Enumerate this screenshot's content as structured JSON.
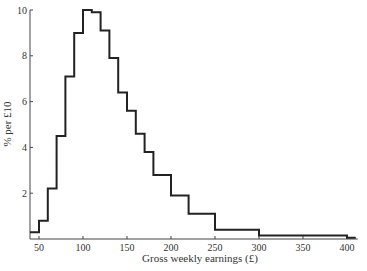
{
  "chart_data": {
    "type": "bar",
    "subtype": "histogram",
    "title": "",
    "xlabel": "Gross weekly earnings (£)",
    "ylabel": "% per £10",
    "xlim": [
      40,
      410
    ],
    "ylim": [
      0,
      10
    ],
    "x_ticks": [
      50,
      100,
      150,
      200,
      250,
      300,
      350,
      400
    ],
    "y_ticks": [
      2,
      4,
      6,
      8,
      10
    ],
    "grid": false,
    "legend": null,
    "bins": [
      {
        "from": 40,
        "to": 50,
        "value": 0.3
      },
      {
        "from": 50,
        "to": 60,
        "value": 0.8
      },
      {
        "from": 60,
        "to": 70,
        "value": 2.2
      },
      {
        "from": 70,
        "to": 80,
        "value": 4.5
      },
      {
        "from": 80,
        "to": 90,
        "value": 7.1
      },
      {
        "from": 90,
        "to": 100,
        "value": 9.0
      },
      {
        "from": 100,
        "to": 110,
        "value": 10.0
      },
      {
        "from": 110,
        "to": 120,
        "value": 9.9
      },
      {
        "from": 120,
        "to": 130,
        "value": 9.1
      },
      {
        "from": 130,
        "to": 140,
        "value": 7.9
      },
      {
        "from": 140,
        "to": 150,
        "value": 6.4
      },
      {
        "from": 150,
        "to": 160,
        "value": 5.6
      },
      {
        "from": 160,
        "to": 170,
        "value": 4.6
      },
      {
        "from": 170,
        "to": 180,
        "value": 3.8
      },
      {
        "from": 180,
        "to": 200,
        "value": 2.8
      },
      {
        "from": 200,
        "to": 220,
        "value": 1.9
      },
      {
        "from": 220,
        "to": 250,
        "value": 1.1
      },
      {
        "from": 250,
        "to": 300,
        "value": 0.4
      },
      {
        "from": 300,
        "to": 400,
        "value": 0.15
      },
      {
        "from": 400,
        "to": 410,
        "value": 0.05
      }
    ]
  },
  "labels": {
    "xlabel": "Gross weekly earnings (£)",
    "ylabel": "% per £10"
  },
  "colors": {
    "line": "#222222",
    "axis": "#444444"
  }
}
